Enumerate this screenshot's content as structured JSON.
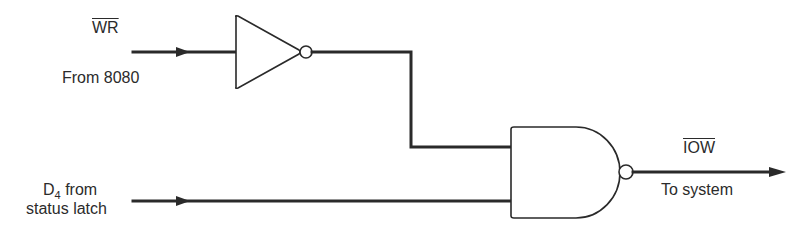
{
  "diagram": {
    "type": "logic-circuit",
    "inputs": [
      {
        "signal": "WR",
        "active_low": true,
        "caption": "From 8080"
      },
      {
        "signal_main": "D",
        "signal_sub": "4",
        "caption_suffix": " from",
        "caption2": "status latch"
      }
    ],
    "gates": [
      {
        "id": "inverter",
        "type": "NOT"
      },
      {
        "id": "nand",
        "type": "NAND"
      }
    ],
    "output": {
      "signal": "IOW",
      "active_low": true,
      "caption": "To system"
    },
    "colors": {
      "ink": "#2a2a2a",
      "background": "#ffffff"
    }
  }
}
